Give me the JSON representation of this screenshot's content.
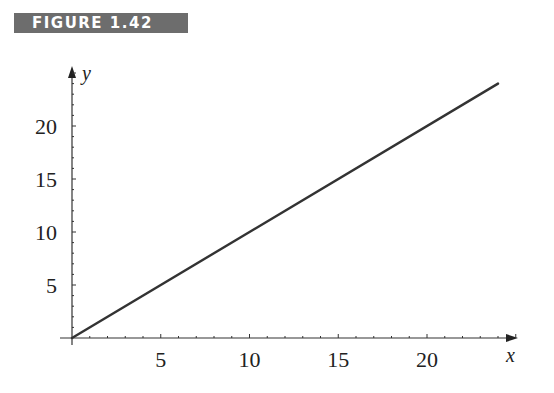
{
  "figure_label": "FIGURE 1.42",
  "chart_data": {
    "type": "line",
    "title": "",
    "xlabel": "x",
    "ylabel": "y",
    "x_ticks": [
      5,
      10,
      15,
      20
    ],
    "y_ticks": [
      5,
      10,
      15,
      20
    ],
    "xlim": [
      0,
      25.5
    ],
    "ylim": [
      0,
      25.5
    ],
    "grid": false,
    "legend": null,
    "series": [
      {
        "name": "y = x",
        "x": [
          0,
          24
        ],
        "y": [
          0,
          24
        ]
      }
    ],
    "tick_labels": {
      "x": [
        "5",
        "10",
        "15",
        "20"
      ],
      "y": [
        "5",
        "10",
        "15",
        "20"
      ]
    }
  }
}
